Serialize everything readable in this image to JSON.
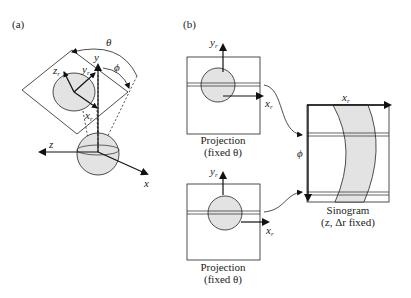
{
  "panel_a": {
    "label": "(a)",
    "axes": {
      "x": "x",
      "y": "y",
      "z": "z"
    },
    "rotated_axes": {
      "x": "x",
      "y": "y",
      "z": "z",
      "subscript": "r"
    },
    "angles": {
      "theta": "θ",
      "phi": "ϕ"
    }
  },
  "panel_b": {
    "label": "(b)",
    "projection_top": {
      "caption_line1": "Projection",
      "caption_line2": "(fixed θ)",
      "x_axis": "x",
      "y_axis": "y",
      "subscript": "r"
    },
    "projection_bottom": {
      "caption_line1": "Projection",
      "caption_line2": "(fixed θ)",
      "x_axis": "x",
      "y_axis": "y",
      "subscript": "r"
    },
    "sinogram": {
      "caption_line1": "Sinogram",
      "caption_line2": "(z, Δr fixed)",
      "x_axis": "x",
      "subscript": "r",
      "y_axis": "ϕ"
    }
  },
  "colors": {
    "fill": "#e3e3e3",
    "stroke": "#222222"
  }
}
